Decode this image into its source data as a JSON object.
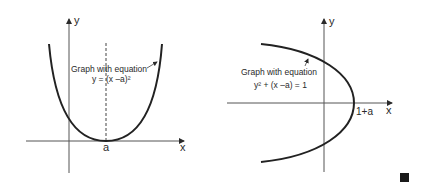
{
  "left_graph": {
    "axis_x_label": "x",
    "axis_y_label": "y",
    "vertex_label": "a",
    "caption_line1": "Graph with equation",
    "caption_line2": "y = (x –a)²"
  },
  "right_graph": {
    "axis_x_label": "x",
    "axis_y_label": "y",
    "vertex_label": "1+a",
    "caption_line1": "Graph with equation",
    "caption_line2": "y² + (x –a) = 1"
  },
  "colors": {
    "ink": "#2a2a2a",
    "background": "#ffffff"
  }
}
